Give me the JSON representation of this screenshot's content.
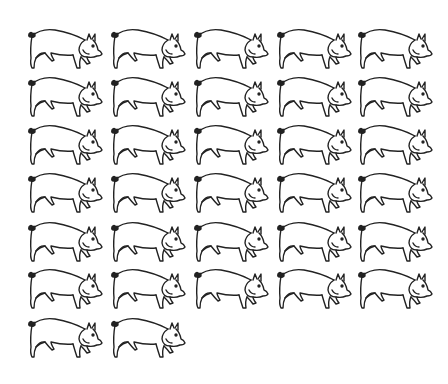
{
  "figure": {
    "pig_count": 32,
    "columns": 5,
    "rows": 7,
    "row_counts": [
      5,
      5,
      5,
      5,
      5,
      5,
      2
    ],
    "line_color": "#222222",
    "background": "#ffffff",
    "icon": "pig-icon"
  },
  "layout": {
    "col_x": [
      27,
      110,
      193,
      276,
      357
    ],
    "row_y": [
      28,
      76,
      124,
      172,
      221,
      268,
      317
    ]
  }
}
